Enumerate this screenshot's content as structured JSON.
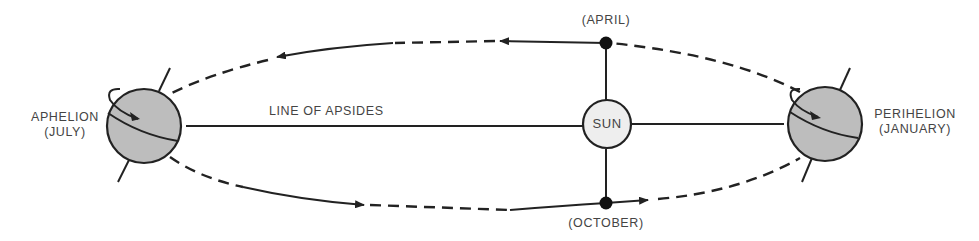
{
  "diagram": {
    "labels": {
      "aphelion": "APHELION",
      "aphelion_month": "(JULY)",
      "perihelion": "PERIHELION",
      "perihelion_month": "(JANUARY)",
      "line_of_apsides": "LINE OF APSIDES",
      "sun": "SUN",
      "april": "(APRIL)",
      "october": "(OCTOBER)"
    },
    "nodes": [
      {
        "id": "aphelion-earth",
        "label": "APHELION (JULY)",
        "type": "globe"
      },
      {
        "id": "sun",
        "label": "SUN",
        "type": "circle"
      },
      {
        "id": "perihelion-earth",
        "label": "PERIHELION (JANUARY)",
        "type": "globe"
      },
      {
        "id": "april-point",
        "label": "(APRIL)",
        "type": "dot"
      },
      {
        "id": "october-point",
        "label": "(OCTOBER)",
        "type": "dot"
      }
    ],
    "edges": [
      {
        "from": "aphelion-earth",
        "to": "sun",
        "label": "LINE OF APSIDES",
        "style": "solid"
      },
      {
        "from": "sun",
        "to": "perihelion-earth",
        "style": "solid"
      },
      {
        "from": "sun",
        "to": "april-point",
        "style": "solid"
      },
      {
        "from": "sun",
        "to": "october-point",
        "style": "solid"
      },
      {
        "from": "perihelion-earth",
        "to": "april-point",
        "style": "orbit-dashed"
      },
      {
        "from": "april-point",
        "to": "aphelion-earth",
        "style": "orbit-mixed",
        "direction": "leftward"
      },
      {
        "from": "aphelion-earth",
        "to": "october-point",
        "style": "orbit-mixed",
        "direction": "rightward"
      },
      {
        "from": "october-point",
        "to": "perihelion-earth",
        "style": "orbit-dashed"
      }
    ],
    "colors": {
      "stroke": "#222222",
      "globe_fill": "#bdbdbd",
      "sun_fill": "#eeeeee",
      "text": "#444444"
    }
  }
}
